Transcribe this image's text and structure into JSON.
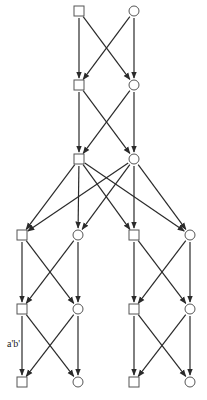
{
  "diagram": {
    "type": "directed-layered-graph",
    "colors": {
      "stroke": "#2a2a2a",
      "background": "#ffffff"
    },
    "nodes": [
      {
        "id": "L1s",
        "shape": "square",
        "x": 79,
        "y": 11
      },
      {
        "id": "L1c",
        "shape": "circle",
        "x": 134,
        "y": 11
      },
      {
        "id": "L2s",
        "shape": "square",
        "x": 79,
        "y": 85
      },
      {
        "id": "L2c",
        "shape": "circle",
        "x": 134,
        "y": 85
      },
      {
        "id": "L3s",
        "shape": "square",
        "x": 79,
        "y": 159
      },
      {
        "id": "L3c",
        "shape": "circle",
        "x": 134,
        "y": 159
      },
      {
        "id": "L4s1",
        "shape": "square",
        "x": 22,
        "y": 235
      },
      {
        "id": "L4c1",
        "shape": "circle",
        "x": 78,
        "y": 235
      },
      {
        "id": "L4s2",
        "shape": "square",
        "x": 134,
        "y": 235
      },
      {
        "id": "L4c2",
        "shape": "circle",
        "x": 190,
        "y": 235
      },
      {
        "id": "L5s1",
        "shape": "square",
        "x": 22,
        "y": 309
      },
      {
        "id": "L5c1",
        "shape": "circle",
        "x": 78,
        "y": 309
      },
      {
        "id": "L5s2",
        "shape": "square",
        "x": 134,
        "y": 309
      },
      {
        "id": "L5c2",
        "shape": "circle",
        "x": 190,
        "y": 309
      },
      {
        "id": "L6s1",
        "shape": "square",
        "x": 22,
        "y": 382
      },
      {
        "id": "L6c1",
        "shape": "circle",
        "x": 78,
        "y": 382
      },
      {
        "id": "L6s2",
        "shape": "square",
        "x": 134,
        "y": 382
      },
      {
        "id": "L6c2",
        "shape": "circle",
        "x": 190,
        "y": 382
      }
    ],
    "edges": [
      [
        "L1s",
        "L2s"
      ],
      [
        "L1s",
        "L2c"
      ],
      [
        "L1c",
        "L2s"
      ],
      [
        "L1c",
        "L2c"
      ],
      [
        "L2s",
        "L3s"
      ],
      [
        "L2s",
        "L3c"
      ],
      [
        "L2c",
        "L3s"
      ],
      [
        "L2c",
        "L3c"
      ],
      [
        "L3s",
        "L4s1"
      ],
      [
        "L3s",
        "L4c1"
      ],
      [
        "L3s",
        "L4s2"
      ],
      [
        "L3s",
        "L4c2"
      ],
      [
        "L3c",
        "L4s1"
      ],
      [
        "L3c",
        "L4c1"
      ],
      [
        "L3c",
        "L4s2"
      ],
      [
        "L3c",
        "L4c2"
      ],
      [
        "L4s1",
        "L5s1"
      ],
      [
        "L4s1",
        "L5c1"
      ],
      [
        "L4c1",
        "L5s1"
      ],
      [
        "L4c1",
        "L5c1"
      ],
      [
        "L4s2",
        "L5s2"
      ],
      [
        "L4s2",
        "L5c2"
      ],
      [
        "L4c2",
        "L5s2"
      ],
      [
        "L4c2",
        "L5c2"
      ],
      [
        "L5s1",
        "L6s1"
      ],
      [
        "L5s1",
        "L6c1"
      ],
      [
        "L5c1",
        "L6s1"
      ],
      [
        "L5c1",
        "L6c1"
      ],
      [
        "L5s2",
        "L6s2"
      ],
      [
        "L5s2",
        "L6c2"
      ],
      [
        "L5c2",
        "L6s2"
      ],
      [
        "L5c2",
        "L6c2"
      ]
    ],
    "edge_label": {
      "text": "a'b'",
      "x": 7,
      "y": 339
    }
  }
}
